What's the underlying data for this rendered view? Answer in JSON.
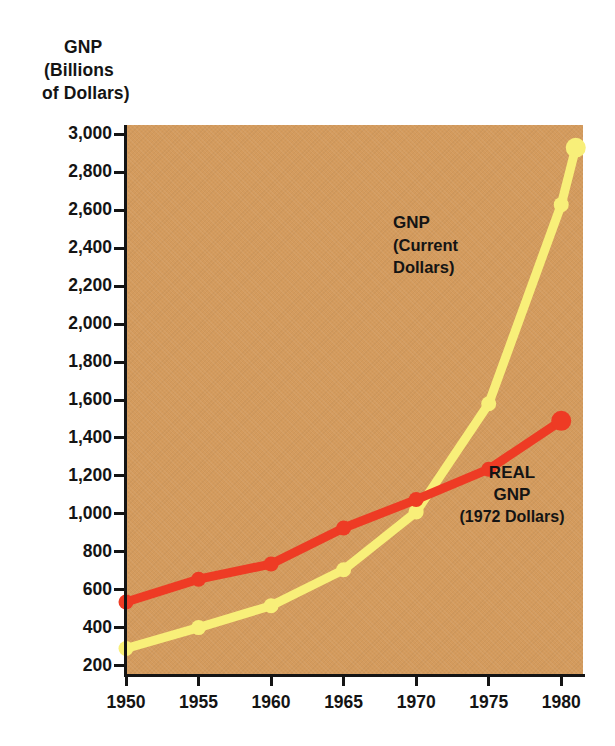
{
  "figure": {
    "y_axis_title_lines": [
      "GNP",
      "(Billions",
      "of  Dollars)"
    ],
    "background_color": "#d49b5d",
    "axis_color": "#141414"
  },
  "annotations": {
    "current": {
      "line1": "GNP",
      "line2": "(Current",
      "line3": "Dollars)"
    },
    "real": {
      "line1": "REAL",
      "line2": "GNP",
      "line3": "(1972 Dollars)"
    }
  },
  "chart_data": {
    "type": "line",
    "title": "GNP",
    "xlabel": "",
    "ylabel": "GNP (Billions of Dollars)",
    "xlim": [
      1950,
      1981.5
    ],
    "ylim": [
      150,
      3050
    ],
    "grid": false,
    "legend_position": "in-plot annotations",
    "ytick_labels": [
      "3,000",
      "2,800",
      "2,600",
      "2,400",
      "2,200",
      "2,000",
      "1,800",
      "1,600",
      "1,400",
      "1,200",
      "1,000",
      "800",
      "600",
      "400",
      "200"
    ],
    "yticks": [
      3000,
      2800,
      2600,
      2400,
      2200,
      2000,
      1800,
      1600,
      1400,
      1200,
      1000,
      800,
      600,
      400,
      200
    ],
    "xtick_labels": [
      "1950",
      "1955",
      "1960",
      "1965",
      "1970",
      "1975",
      "1980"
    ],
    "xticks": [
      1950,
      1955,
      1960,
      1965,
      1970,
      1975,
      1980
    ],
    "series": [
      {
        "name": "GNP (Current Dollars)",
        "color": "#f8ef79",
        "x": [
          1950,
          1955,
          1960,
          1965,
          1970,
          1975,
          1980,
          1981
        ],
        "values": [
          290,
          400,
          515,
          705,
          1010,
          1580,
          2630,
          2930
        ]
      },
      {
        "name": "REAL GNP (1972 Dollars)",
        "color": "#ee3b24",
        "x": [
          1950,
          1955,
          1960,
          1965,
          1970,
          1975,
          1980
        ],
        "values": [
          535,
          655,
          735,
          925,
          1075,
          1235,
          1490
        ]
      }
    ]
  }
}
